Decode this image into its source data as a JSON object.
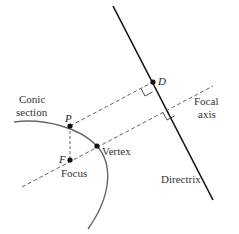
{
  "diagram": {
    "labels": {
      "conic_line1": "Conic",
      "conic_line2": "section",
      "point_p": "P",
      "point_f": "F",
      "focus": "Focus",
      "vertex": "Vertex",
      "point_d": "D",
      "focal_line1": "Focal",
      "focal_line2": "axis",
      "directrix": "Directrix"
    },
    "colors": {
      "directrix": "#111111",
      "curve": "#666666",
      "dashed": "#555555",
      "points": "#111111"
    },
    "points": {
      "P": [
        70,
        126
      ],
      "F": [
        70,
        160
      ],
      "Vertex": [
        97,
        146
      ],
      "D": [
        153,
        82
      ]
    }
  }
}
